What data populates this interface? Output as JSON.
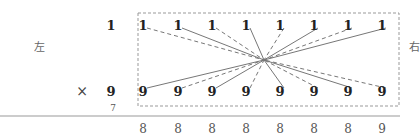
{
  "diagram": {
    "left_label": "左",
    "right_label": "右",
    "multiply_sign": "×",
    "multiplicand": "1",
    "multiplier": "9",
    "carry": "7",
    "top_row": [
      "1",
      "1",
      "1",
      "1",
      "1",
      "1",
      "1",
      "1"
    ],
    "bottom_row": [
      "9",
      "9",
      "9",
      "9",
      "9",
      "9",
      "9",
      "9"
    ],
    "result_row": [
      "8",
      "8",
      "8",
      "8",
      "8",
      "8",
      "8",
      "9"
    ],
    "line_styles_top": [
      "dashed",
      "solid",
      "dashed",
      "solid",
      "dashed",
      "solid",
      "dashed",
      "solid"
    ],
    "line_styles_bottom": [
      "solid",
      "dashed",
      "solid",
      "dashed",
      "solid",
      "dashed",
      "solid",
      "dashed"
    ],
    "colors": {
      "line": "#777777",
      "box": "#999999",
      "rule": "#999999"
    }
  }
}
